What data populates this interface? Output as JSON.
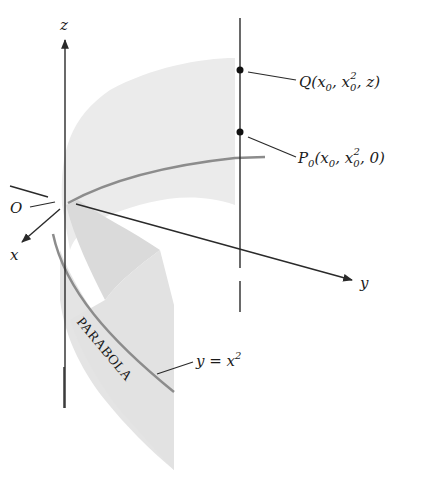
{
  "figure": {
    "type": "3D parabolic cylinder diagram",
    "axes": {
      "z_label": "z",
      "y_label": "y",
      "x_label": "x",
      "origin_label": "O"
    },
    "points": {
      "Q": {
        "name": "Q",
        "coords": "(x0, x0², z)",
        "prefix": "Q(x",
        "sub0": "0",
        "mid": ", x",
        "sub1": "0",
        "sup": "2",
        "suffix": ", z)"
      },
      "P0": {
        "name": "P0",
        "prefix": "P",
        "sub_p": "0",
        "open": "(x",
        "sub0": "0",
        "mid": ", x",
        "sub1": "0",
        "sup": "2",
        "suffix": ", 0)"
      }
    },
    "curve_label": {
      "prefix": "y = x",
      "sup": "2"
    },
    "surface_label": "PARABOLA",
    "colors": {
      "surface_fill": "#e6e6e6",
      "surface_dark": "#d6d6d6",
      "curve": "#8c8c8c",
      "axis": "#2a2a2a"
    }
  }
}
